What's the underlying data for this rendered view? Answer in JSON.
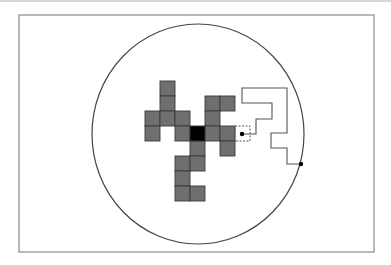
{
  "figure": {
    "title": "",
    "frame": {
      "x": 19,
      "y": 15,
      "width": 355,
      "height": 237,
      "stroke": "#8a8a8a"
    },
    "circle": {
      "cx": 198,
      "cy": 134,
      "rx": 106,
      "ry": 110,
      "stroke": "#444444"
    },
    "grid": {
      "origin_x": 145,
      "origin_y": 81,
      "cell": 15
    },
    "colors": {
      "cell_fill": "#6f6f6f",
      "cell_stroke": "#3a3a3a",
      "seed_fill": "#000000",
      "path_stroke": "#555555",
      "dot": "#000000"
    },
    "aggregate_cells": [
      {
        "col": 1,
        "row": 0
      },
      {
        "col": 1,
        "row": 1
      },
      {
        "col": 4,
        "row": 1
      },
      {
        "col": 5,
        "row": 1
      },
      {
        "col": 0,
        "row": 2
      },
      {
        "col": 1,
        "row": 2
      },
      {
        "col": 2,
        "row": 2
      },
      {
        "col": 4,
        "row": 2
      },
      {
        "col": 0,
        "row": 3
      },
      {
        "col": 2,
        "row": 3
      },
      {
        "col": 4,
        "row": 3
      },
      {
        "col": 5,
        "row": 3
      },
      {
        "col": 3,
        "row": 4
      },
      {
        "col": 5,
        "row": 4
      },
      {
        "col": 2,
        "row": 5
      },
      {
        "col": 3,
        "row": 5
      },
      {
        "col": 2,
        "row": 6
      },
      {
        "col": 2,
        "row": 7
      },
      {
        "col": 3,
        "row": 7
      }
    ],
    "seed_cell": {
      "col": 3,
      "row": 3
    },
    "candidate_cell": {
      "col": 6,
      "row": 3,
      "style": "dashed"
    },
    "random_walk_path": [
      [
        301,
        164
      ],
      [
        287,
        164
      ],
      [
        287,
        148
      ],
      [
        271,
        148
      ],
      [
        271,
        133
      ],
      [
        287,
        133
      ],
      [
        287,
        88
      ],
      [
        242,
        88
      ],
      [
        242,
        103
      ],
      [
        272,
        103
      ],
      [
        272,
        119
      ],
      [
        256,
        119
      ],
      [
        256,
        134
      ],
      [
        242,
        134
      ]
    ],
    "walk_start_dot": {
      "x": 301,
      "y": 164
    },
    "walk_end_dot": {
      "x": 242,
      "y": 134
    }
  }
}
